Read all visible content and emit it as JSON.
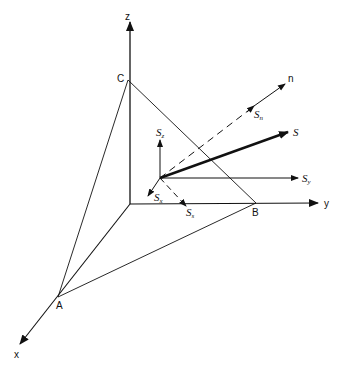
{
  "diagram": {
    "type": "3d-stress-tetrahedron",
    "axes": {
      "x": {
        "label": "x"
      },
      "y": {
        "label": "y"
      },
      "z": {
        "label": "z"
      },
      "n": {
        "label": "n"
      }
    },
    "points": {
      "A": {
        "label": "A"
      },
      "B": {
        "label": "B"
      },
      "C": {
        "label": "C"
      }
    },
    "vectors": {
      "S": {
        "label": "S",
        "sub": ""
      },
      "Sn": {
        "label": "S",
        "sub": "n"
      },
      "Sx": {
        "label": "S",
        "sub": "x"
      },
      "Sy": {
        "label": "S",
        "sub": "y"
      },
      "Sz": {
        "label": "S",
        "sub": "z"
      },
      "Ss": {
        "label": "S",
        "sub": "s"
      }
    },
    "colors": {
      "stroke": "#111111",
      "background": "#ffffff"
    }
  }
}
